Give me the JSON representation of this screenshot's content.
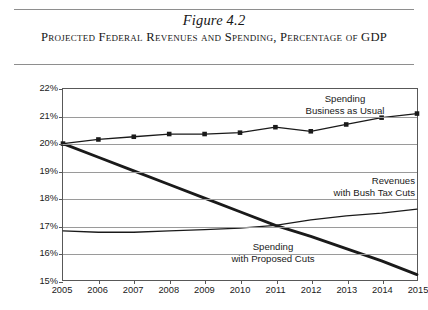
{
  "figure": {
    "number": "Figure 4.2",
    "caption": "Projected Federal Revenues and Spending, Percentage of GDP"
  },
  "axes": {
    "y_title": "Percentage of GDP",
    "y_ticks": [
      "15%",
      "16%",
      "17%",
      "18%",
      "19%",
      "20%",
      "21%",
      "22%"
    ],
    "x_ticks": [
      "2005",
      "2006",
      "2007",
      "2008",
      "2009",
      "2010",
      "2011",
      "2012",
      "2013",
      "2014",
      "2015"
    ]
  },
  "annotations": {
    "spending_bau_line1": "Spending",
    "spending_bau_line2": "Business as Usual",
    "revenues_line1": "Revenues",
    "revenues_line2": "with Bush Tax Cuts",
    "spending_cuts_line1": "Spending",
    "spending_cuts_line2": "with Proposed Cuts"
  },
  "colors": {
    "line": "#1a1a1a",
    "grid": "#9a9a9a",
    "frame": "#585858",
    "rule": "#8e8e8e"
  },
  "chart_data": {
    "type": "line",
    "title": "Projected Federal Revenues and Spending, Percentage of GDP",
    "xlabel": "",
    "ylabel": "Percentage of GDP",
    "xlim": [
      2005,
      2015
    ],
    "ylim": [
      15,
      22
    ],
    "grid": true,
    "legend": "inline-annotations",
    "x": [
      2005,
      2006,
      2007,
      2008,
      2009,
      2010,
      2011,
      2012,
      2013,
      2014,
      2015
    ],
    "series": [
      {
        "name": "Spending Business as Usual",
        "marker": "square",
        "values": [
          20.0,
          20.15,
          20.25,
          20.35,
          20.35,
          20.4,
          20.6,
          20.45,
          20.7,
          20.95,
          21.1
        ]
      },
      {
        "name": "Revenues with Bush Tax Cuts",
        "marker": "none",
        "values": [
          16.8,
          16.75,
          16.75,
          16.8,
          16.85,
          16.9,
          17.0,
          17.2,
          17.35,
          17.45,
          17.6
        ]
      },
      {
        "name": "Spending with Proposed Cuts",
        "marker": "tick",
        "values": [
          20.0,
          19.5,
          19.0,
          18.5,
          18.0,
          17.5,
          17.0,
          16.6,
          16.15,
          15.7,
          15.2
        ]
      }
    ]
  }
}
